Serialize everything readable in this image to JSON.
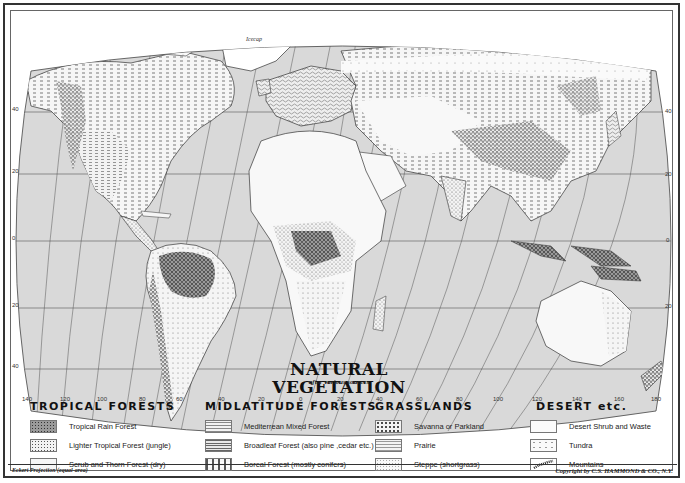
{
  "map": {
    "title": "NATURAL VEGETATION",
    "subtitle": "after various sources",
    "projection_note": "Eckert Projection (equal-area)",
    "copyright": "Copyright by C.S. HAMMOND & CO., N.Y.",
    "icecap_label": "Icecap",
    "ocean_color": "#d9d9d9",
    "land_color": "#f7f7f7",
    "gridline_color": "#555555"
  },
  "longitude_labels": [
    {
      "label": "140",
      "x": 20
    },
    {
      "label": "120",
      "x": 50
    },
    {
      "label": "100",
      "x": 80
    },
    {
      "label": "80",
      "x": 112
    },
    {
      "label": "60",
      "x": 140
    },
    {
      "label": "40",
      "x": 170
    },
    {
      "label": "20",
      "x": 200
    },
    {
      "label": "0",
      "x": 230
    },
    {
      "label": "20",
      "x": 260
    },
    {
      "label": "40",
      "x": 290
    },
    {
      "label": "60",
      "x": 320
    },
    {
      "label": "80",
      "x": 348
    },
    {
      "label": "100",
      "x": 378
    },
    {
      "label": "120",
      "x": 407
    },
    {
      "label": "140",
      "x": 437
    },
    {
      "label": "160",
      "x": 468
    },
    {
      "label": "180",
      "x": 498
    }
  ],
  "latitude_labels_left": [
    {
      "label": "40",
      "y": 106
    },
    {
      "label": "20",
      "y": 168
    },
    {
      "label": "0",
      "y": 235
    },
    {
      "label": "20",
      "y": 302
    },
    {
      "label": "40",
      "y": 363
    }
  ],
  "latitude_labels_right": [
    {
      "label": "40",
      "y": 108
    },
    {
      "label": "20",
      "y": 171
    },
    {
      "label": "0",
      "y": 237
    },
    {
      "label": "20",
      "y": 303
    }
  ],
  "legend": {
    "groups": [
      {
        "heading": "TROPICAL FORESTS",
        "items": [
          {
            "label": "Tropical Rain Forest",
            "pattern": "dense-dark"
          },
          {
            "label": "Lighter Tropical Forest (jungle)",
            "pattern": "medium-dots"
          },
          {
            "label": "Scrub and Thorn Forest (dry)",
            "pattern": "light-dots"
          }
        ]
      },
      {
        "heading": "MIDLATITUDE FORESTS",
        "items": [
          {
            "label": "Mediterrean Mixed Forest",
            "pattern": "fine-dashes"
          },
          {
            "label": "Broadleaf Forest (also pine ,cedar etc.)",
            "pattern": "wavy-lines"
          },
          {
            "label": "Boreal Forest (mostly conifers)",
            "pattern": "sparse-ticks"
          }
        ]
      },
      {
        "heading": "GRASSLANDS",
        "items": [
          {
            "label": "Savanna or Parkland",
            "pattern": "tick-grid"
          },
          {
            "label": "Prairie",
            "pattern": "dash-rows"
          },
          {
            "label": "Steppe (shortgrass)",
            "pattern": "faint-dots"
          }
        ]
      },
      {
        "heading": "DESERT etc.",
        "items": [
          {
            "label": "Desert Shrub and Waste",
            "pattern": "blank"
          },
          {
            "label": "Tundra",
            "pattern": "very-sparse-dots"
          },
          {
            "label": "Mountains",
            "pattern": "mountain-hatch"
          }
        ]
      }
    ]
  }
}
